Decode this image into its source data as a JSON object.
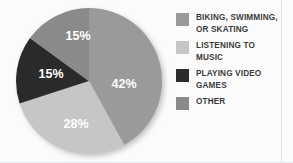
{
  "chart_data": {
    "type": "pie",
    "title": "",
    "subtitle": "",
    "xlabel": "",
    "ylabel": "",
    "grid": false,
    "legend_position": "right",
    "start_angle_deg": 0,
    "direction": "clockwise",
    "categories": [
      "BIKING, SWIMMING, OR SKATING",
      "LISTENING TO MUSIC",
      "PLAYING VIDEO GAMES",
      "OTHER"
    ],
    "values": [
      42,
      28,
      15,
      15
    ],
    "value_labels": [
      "42%",
      "28%",
      "15%",
      "15%"
    ],
    "colors": [
      "#9a9a9a",
      "#c6c6c6",
      "#2b2b2b",
      "#8a8a8a"
    ],
    "slices": [
      {
        "label": "BIKING, SWIMMING, OR SKATING",
        "legend_label": "BIKING, SWIMMING,\nOR SKATING",
        "value": 42,
        "value_label": "42%",
        "color": "#9a9a9a",
        "start_deg": 0,
        "end_deg": 151.2,
        "label_x": 114,
        "label_y": 86
      },
      {
        "label": "LISTENING TO MUSIC",
        "legend_label": "LISTENING TO\nMUSIC",
        "value": 28,
        "value_label": "28%",
        "color": "#c6c6c6",
        "start_deg": 151.2,
        "end_deg": 252.0,
        "label_x": 66,
        "label_y": 126
      },
      {
        "label": "PLAYING VIDEO GAMES",
        "legend_label": "PLAYING VIDEO\nGAMES",
        "value": 15,
        "value_label": "15%",
        "color": "#2b2b2b",
        "start_deg": 252.0,
        "end_deg": 306.0,
        "label_x": 41,
        "label_y": 76
      },
      {
        "label": "OTHER",
        "legend_label": "OTHER",
        "value": 15,
        "value_label": "15%",
        "color": "#8a8a8a",
        "start_deg": 306.0,
        "end_deg": 360.0,
        "label_x": 68,
        "label_y": 38
      }
    ]
  },
  "legend": {
    "items": [
      {
        "label": "BIKING, SWIMMING,\nOR SKATING",
        "color": "#9a9a9a",
        "name": "legend-item-biking-swimming-skating"
      },
      {
        "label": "LISTENING TO\nMUSIC",
        "color": "#c6c6c6",
        "name": "legend-item-listening-to-music"
      },
      {
        "label": "PLAYING VIDEO\nGAMES",
        "color": "#2b2b2b",
        "name": "legend-item-playing-video-games"
      },
      {
        "label": "OTHER",
        "color": "#8a8a8a",
        "name": "legend-item-other"
      }
    ]
  }
}
